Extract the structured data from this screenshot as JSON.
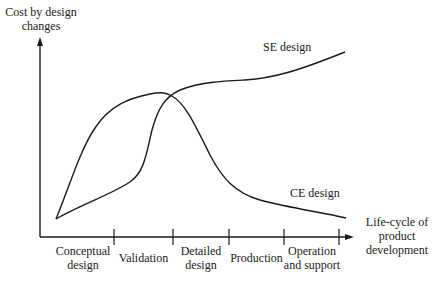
{
  "y_axis": {
    "label_line1": "Cost by design",
    "label_line2": "changes"
  },
  "x_axis": {
    "label_line1": "Life-cycle of",
    "label_line2": "product",
    "label_line3": "development"
  },
  "series": [
    {
      "name": "SE design",
      "label": "SE design"
    },
    {
      "name": "CE design",
      "label": "CE design"
    }
  ],
  "phases": [
    {
      "line1": "Conceptual",
      "line2": "design"
    },
    {
      "line1": "Validation",
      "line2": ""
    },
    {
      "line1": "Detailed",
      "line2": "design"
    },
    {
      "line1": "Production",
      "line2": ""
    },
    {
      "line1": "Operation",
      "line2": "and support"
    }
  ],
  "colors": {
    "line": "#1a1a1a",
    "background": "#ffffff"
  }
}
